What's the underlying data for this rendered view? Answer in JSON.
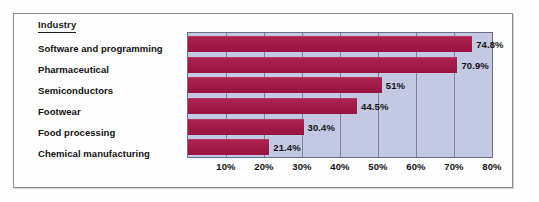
{
  "chart_data": {
    "type": "bar",
    "orientation": "horizontal",
    "title": "",
    "legend_title": "Industry",
    "xlabel": "",
    "ylabel": "Industry",
    "categories": [
      "Software and programming",
      "Pharmaceutical",
      "Semiconductors",
      "Footwear",
      "Food processing",
      "Chemical manufacturing"
    ],
    "values": [
      74.8,
      70.9,
      51,
      44.5,
      30.4,
      21.4
    ],
    "value_labels": [
      "74.8%",
      "70.9%",
      "51%",
      "44.5%",
      "30.4%",
      "21.4%"
    ],
    "xlim": [
      0,
      80
    ],
    "xticks": [
      10,
      20,
      30,
      40,
      50,
      60,
      70,
      80
    ],
    "xtick_labels": [
      "10%",
      "20%",
      "30%",
      "40%",
      "50%",
      "60%",
      "70%",
      "80%"
    ],
    "grid": true,
    "grid_axis": "x",
    "legend_position": "none",
    "colors": {
      "bar": "#a61e4d",
      "plot_background": "#c3c9e2",
      "gridline": "#7d829a",
      "plot_border": "#6a6f86",
      "frame_border": "#8b8b93",
      "page_background": "#fdfdfd",
      "text": "#111111"
    }
  }
}
